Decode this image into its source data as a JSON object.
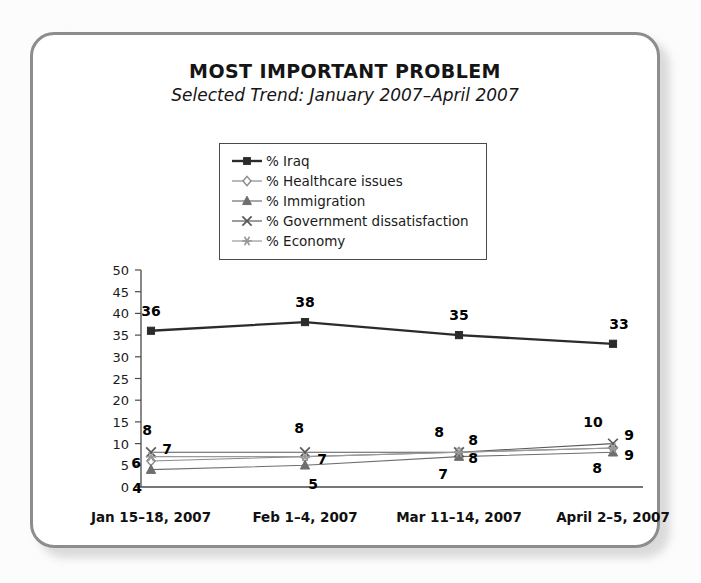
{
  "header": {
    "title": "MOST IMPORTANT PROBLEM",
    "subtitle": "Selected Trend: January 2007–April 2007"
  },
  "chart_data": {
    "type": "line",
    "title": "MOST IMPORTANT PROBLEM",
    "subtitle": "Selected Trend: January 2007–April 2007",
    "xlabel": "",
    "ylabel": "",
    "ylim": [
      0,
      50
    ],
    "yticks": [
      0,
      5,
      10,
      15,
      20,
      25,
      30,
      35,
      40,
      45,
      50
    ],
    "grid": false,
    "legend_position": "top-center",
    "categories": [
      "Jan 15–18, 2007",
      "Feb 1–4, 2007",
      "Mar 11–14, 2007",
      "April 2–5, 2007"
    ],
    "series": [
      {
        "name": "% Iraq",
        "marker": "square",
        "color": "#2b2b2b",
        "values": [
          36,
          38,
          35,
          33
        ]
      },
      {
        "name": "% Healthcare issues",
        "marker": "diamond",
        "color": "#8a8a8a",
        "values": [
          6,
          7,
          8,
          9
        ]
      },
      {
        "name": "% Immigration",
        "marker": "triangle",
        "color": "#6e6e6e",
        "values": [
          4,
          5,
          7,
          8
        ]
      },
      {
        "name": "% Government dissatisfaction",
        "marker": "x",
        "color": "#5a5a5a",
        "values": [
          8,
          8,
          8,
          10
        ]
      },
      {
        "name": "% Economy",
        "marker": "asterisk",
        "color": "#9a9a9a",
        "values": [
          7,
          7,
          8,
          9
        ]
      }
    ],
    "point_labels": [
      {
        "series": "% Iraq",
        "index": 0,
        "text": "36"
      },
      {
        "series": "% Iraq",
        "index": 1,
        "text": "38"
      },
      {
        "series": "% Iraq",
        "index": 2,
        "text": "35"
      },
      {
        "series": "% Iraq",
        "index": 3,
        "text": "33"
      },
      {
        "series": "% Government dissatisfaction",
        "index": 0,
        "text": "8"
      },
      {
        "series": "% Economy",
        "index": 0,
        "text": "7"
      },
      {
        "series": "% Healthcare issues",
        "index": 0,
        "text": "6"
      },
      {
        "series": "% Immigration",
        "index": 0,
        "text": "4"
      },
      {
        "series": "% Government dissatisfaction",
        "index": 1,
        "text": "8"
      },
      {
        "series": "% Economy",
        "index": 1,
        "text": "7"
      },
      {
        "series": "% Immigration",
        "index": 1,
        "text": "5"
      },
      {
        "series": "% Government dissatisfaction",
        "index": 2,
        "text": "8"
      },
      {
        "series": "% Economy",
        "index": 2,
        "text": "8"
      },
      {
        "series": "% Healthcare issues",
        "index": 2,
        "text": "8"
      },
      {
        "series": "% Immigration",
        "index": 2,
        "text": "7"
      },
      {
        "series": "% Government dissatisfaction",
        "index": 3,
        "text": "10"
      },
      {
        "series": "% Economy",
        "index": 3,
        "text": "9"
      },
      {
        "series": "% Healthcare issues",
        "index": 3,
        "text": "9"
      },
      {
        "series": "% Immigration",
        "index": 3,
        "text": "8"
      }
    ],
    "label_offsets": [
      {
        "dx": 0,
        "dy": -20
      },
      {
        "dx": 0,
        "dy": -20
      },
      {
        "dx": 0,
        "dy": -20
      },
      {
        "dx": 6,
        "dy": -20
      },
      {
        "dx": -4,
        "dy": -22
      },
      {
        "dx": 16,
        "dy": -8
      },
      {
        "dx": -15,
        "dy": 2
      },
      {
        "dx": -14,
        "dy": 18
      },
      {
        "dx": -6,
        "dy": -24
      },
      {
        "dx": 17,
        "dy": 2
      },
      {
        "dx": 8,
        "dy": 19
      },
      {
        "dx": -20,
        "dy": -20
      },
      {
        "dx": 14,
        "dy": -12
      },
      {
        "dx": 14,
        "dy": 6
      },
      {
        "dx": -16,
        "dy": 17
      },
      {
        "dx": -20,
        "dy": -22
      },
      {
        "dx": 16,
        "dy": -13
      },
      {
        "dx": 16,
        "dy": 7
      },
      {
        "dx": -16,
        "dy": 16
      }
    ]
  }
}
